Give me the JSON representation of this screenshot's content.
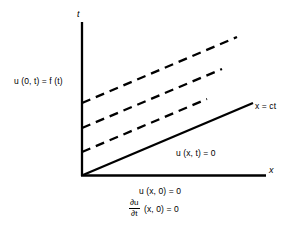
{
  "figure": {
    "type": "diagram",
    "axes": {
      "vertical_label": "t",
      "horizontal_label": "x",
      "origin_px": [
        82,
        175
      ]
    },
    "labels": {
      "boundary_condition": "u (0, t) = f (t)",
      "characteristic_line": "x = ct",
      "interior_solution": "u (x, t) = 0",
      "initial_displacement": "u (x, 0) = 0",
      "initial_velocity_numerator": "∂u",
      "initial_velocity_denominator": "∂t",
      "initial_velocity_tail": "(x, 0) = 0"
    },
    "colors": {
      "ink": "#000000",
      "background": "#ffffff"
    },
    "geometry": {
      "axis_stroke_width": 2.3,
      "line_stroke_width": 2.3,
      "dash_pattern": "9 6",
      "t_axis": {
        "x": 82,
        "y_top": 22,
        "y_bottom": 176
      },
      "x_axis": {
        "y": 175.5,
        "x_left": 81,
        "x_right": 266
      },
      "solid_characteristic": {
        "x1": 83,
        "y1": 175,
        "x2": 253,
        "y2": 103
      },
      "dashed_characteristics": [
        {
          "x1": 82,
          "y1": 152,
          "x2": 207,
          "y2": 99
        },
        {
          "x1": 82,
          "y1": 128,
          "x2": 222,
          "y2": 69
        },
        {
          "x1": 82,
          "y1": 103,
          "x2": 237,
          "y2": 37
        }
      ]
    }
  }
}
